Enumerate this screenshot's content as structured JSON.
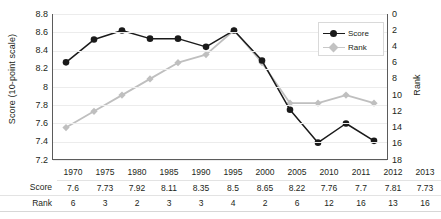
{
  "chart_data": {
    "type": "line",
    "title": "",
    "xlabel": "",
    "categories": [
      "1970",
      "1975",
      "1980",
      "1985",
      "1990",
      "1995",
      "2000",
      "2005",
      "2010",
      "2011",
      "2012",
      "2013"
    ],
    "series": [
      {
        "name": "Score",
        "axis": "left",
        "color": "#1a1a1a",
        "marker": "circle",
        "values": [
          8.27,
          8.52,
          8.62,
          8.53,
          8.53,
          8.44,
          8.62,
          8.29,
          7.75,
          7.39,
          7.6,
          7.41
        ]
      },
      {
        "name": "Rank",
        "axis": "right",
        "color": "#bfbfbf",
        "marker": "diamond",
        "values": [
          14,
          12,
          10,
          8,
          6,
          5,
          2,
          6,
          11,
          11,
          10,
          11
        ]
      }
    ],
    "left_axis": {
      "label": "Score (10-point scale)",
      "ticks": [
        "8.8",
        "8.6",
        "8.4",
        "8.2",
        "8",
        "7.8",
        "7.6",
        "7.4",
        "7.2"
      ],
      "min": 7.2,
      "max": 8.8,
      "step": 0.2,
      "inverted": false
    },
    "right_axis": {
      "label": "Rank",
      "ticks": [
        "0",
        "2",
        "4",
        "6",
        "8",
        "10",
        "12",
        "14",
        "16",
        "18"
      ],
      "min": 0,
      "max": 18,
      "step": 2,
      "inverted": true
    },
    "grid": true,
    "legend_position": "top-right",
    "legend": [
      "Score",
      "Rank"
    ]
  },
  "legend": {
    "score_label": "Score",
    "rank_label": "Rank"
  },
  "axis": {
    "left_title": "Score (10-point scale)",
    "right_title": "Rank"
  },
  "table": {
    "header": [
      "",
      "1970",
      "1975",
      "1980",
      "1985",
      "1990",
      "1995",
      "2000",
      "2005",
      "2010",
      "2011",
      "2012",
      "2013"
    ],
    "rows": [
      {
        "label": "Score",
        "values": [
          "7.6",
          "7.73",
          "7.92",
          "8.11",
          "8.35",
          "8.5",
          "8.65",
          "8.22",
          "7.76",
          "7.7",
          "7.81",
          "7.73"
        ]
      },
      {
        "label": "Rank",
        "values": [
          "6",
          "3",
          "2",
          "3",
          "3",
          "4",
          "2",
          "6",
          "12",
          "16",
          "13",
          "16"
        ]
      }
    ]
  },
  "colors": {
    "score": "#1a1a1a",
    "rank": "#c2c2c2",
    "grid": "#ececec",
    "axis": "#5b5b5b"
  }
}
